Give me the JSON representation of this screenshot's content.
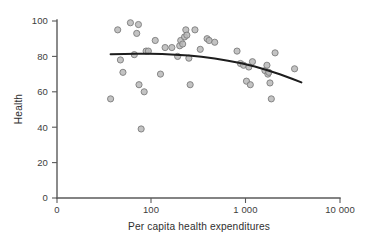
{
  "chart_data": {
    "type": "scatter",
    "title": "",
    "xlabel": "Per capita health expenditures",
    "ylabel": "Health",
    "xscale": "log",
    "yscale": "linear",
    "xlim": [
      10,
      10000
    ],
    "ylim": [
      0,
      100
    ],
    "grid": false,
    "legend": null,
    "x_tick_labels": [
      "0",
      "100",
      "1 000",
      "10 000"
    ],
    "x_tick_values": [
      10,
      100,
      1000,
      10000
    ],
    "y_tick_labels": [
      "0",
      "20",
      "40",
      "60",
      "80",
      "100"
    ],
    "y_tick_values": [
      0,
      20,
      40,
      60,
      80,
      100
    ],
    "point_color": "#b9b9b9",
    "point_edge_color": "#7d7d7d",
    "curve_color": "#1d1d1d",
    "axis_color": "#5a5a5a",
    "series": [
      {
        "name": "Countries",
        "points": [
          [
            37,
            56
          ],
          [
            44,
            95
          ],
          [
            47,
            78
          ],
          [
            50,
            71
          ],
          [
            60,
            99
          ],
          [
            66,
            81
          ],
          [
            70,
            93
          ],
          [
            73,
            98
          ],
          [
            74,
            64
          ],
          [
            78,
            39
          ],
          [
            84,
            60
          ],
          [
            88,
            83
          ],
          [
            93,
            83
          ],
          [
            110,
            89
          ],
          [
            125,
            70
          ],
          [
            140,
            85
          ],
          [
            165,
            85
          ],
          [
            190,
            80
          ],
          [
            200,
            86
          ],
          [
            205,
            89
          ],
          [
            215,
            87
          ],
          [
            225,
            91
          ],
          [
            232,
            95
          ],
          [
            238,
            92
          ],
          [
            250,
            79
          ],
          [
            258,
            64
          ],
          [
            290,
            95
          ],
          [
            330,
            84
          ],
          [
            390,
            90
          ],
          [
            410,
            89
          ],
          [
            470,
            88
          ],
          [
            810,
            83
          ],
          [
            880,
            76
          ],
          [
            950,
            75
          ],
          [
            1020,
            66
          ],
          [
            1080,
            74
          ],
          [
            1120,
            64
          ],
          [
            1180,
            77
          ],
          [
            1600,
            72
          ],
          [
            1680,
            75
          ],
          [
            1720,
            70
          ],
          [
            1760,
            71
          ],
          [
            1810,
            65
          ],
          [
            1870,
            56
          ],
          [
            2050,
            82
          ],
          [
            3300,
            73
          ]
        ]
      }
    ],
    "fit_curve": {
      "name": "Fitted trend",
      "points": [
        [
          37,
          81.2
        ],
        [
          52,
          81.4
        ],
        [
          70,
          81.5
        ],
        [
          95,
          81.5
        ],
        [
          130,
          81.3
        ],
        [
          180,
          81.0
        ],
        [
          250,
          80.5
        ],
        [
          340,
          79.8
        ],
        [
          470,
          78.8
        ],
        [
          650,
          77.6
        ],
        [
          900,
          76.1
        ],
        [
          1250,
          74.3
        ],
        [
          1700,
          72.2
        ],
        [
          2300,
          69.9
        ],
        [
          3100,
          67.4
        ],
        [
          3900,
          65.3
        ]
      ]
    }
  }
}
